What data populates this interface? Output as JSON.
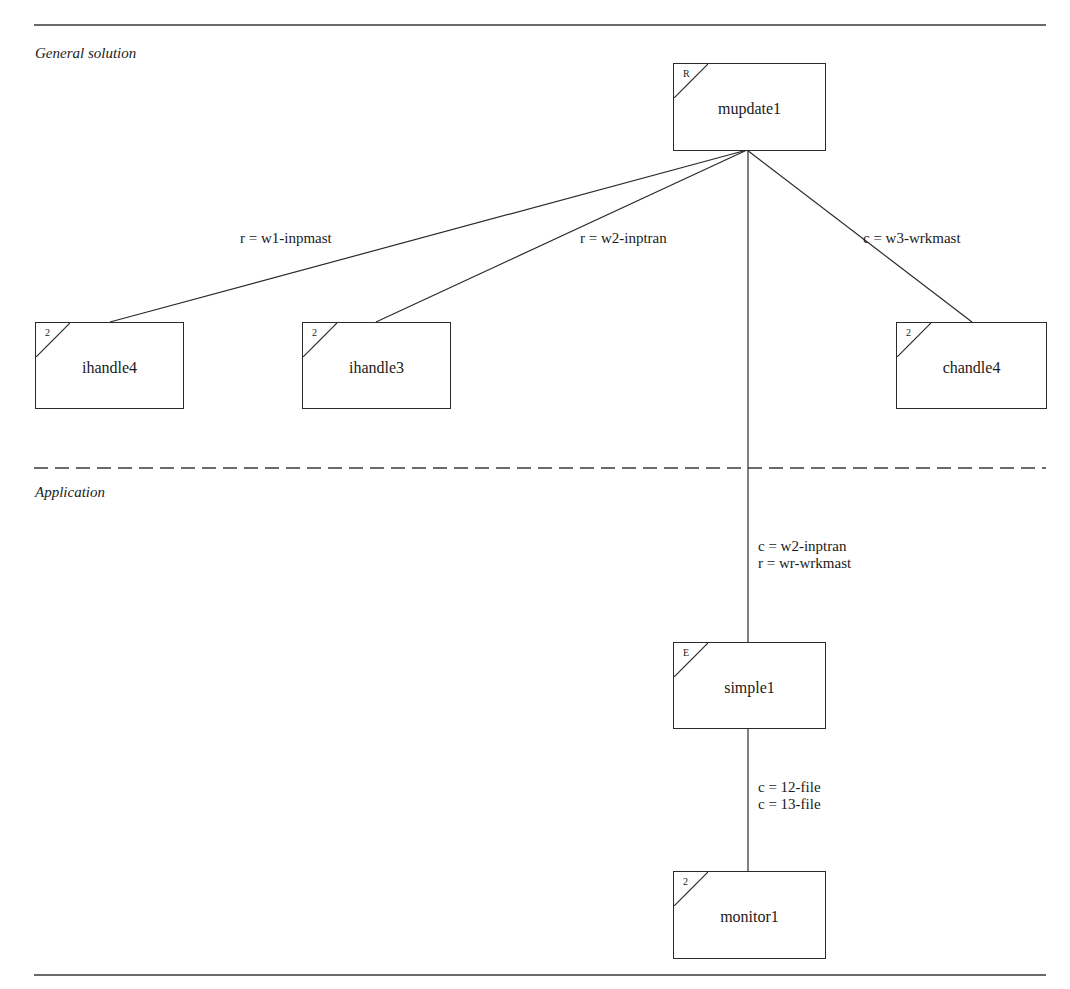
{
  "sections": {
    "general": "General solution",
    "application": "Application"
  },
  "nodes": {
    "mupdate1": {
      "name": "mupdate1",
      "corner": "R"
    },
    "ihandle4": {
      "name": "ihandle4",
      "corner": "2"
    },
    "ihandle3": {
      "name": "ihandle3",
      "corner": "2"
    },
    "chandle4": {
      "name": "chandle4",
      "corner": "2"
    },
    "simple1": {
      "name": "simple1",
      "corner": "E"
    },
    "monitor1": {
      "name": "monitor1",
      "corner": "2"
    }
  },
  "edges": {
    "mupdate1_ihandle4": "r = w1-inpmast",
    "mupdate1_ihandle3": "r = w2-inptran",
    "mupdate1_chandle4": "c = w3-wrkmast",
    "mupdate1_simple1": [
      "c = w2-inptran",
      "r = wr-wrkmast"
    ],
    "simple1_monitor1": [
      "c = 12-file",
      "c = 13-file"
    ]
  },
  "colors": {
    "line": "#2a2a2a",
    "background": "#ffffff"
  }
}
